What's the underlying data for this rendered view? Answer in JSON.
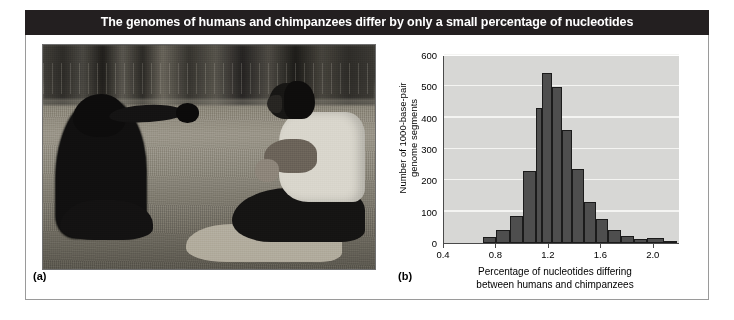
{
  "figure": {
    "title": "The genomes of humans and chimpanzees differ by only a small percentage of nucleotides",
    "title_bg": "#231f20",
    "title_color": "#ffffff",
    "frame_border": "#9a9a9a"
  },
  "panel_a": {
    "label": "(a)",
    "photo_alt": "Black-and-white photograph of a chimpanzee and a man sitting facing each other on grass, the chimpanzee reaching out toward the man"
  },
  "panel_b": {
    "label": "(b)"
  },
  "chart_data": {
    "type": "bar",
    "title": "",
    "subtitle": "",
    "xlabel": "Percentage of nucleotides differing between humans and chimpanzees",
    "xlabel_line1": "Percentage of nucleotides differing",
    "xlabel_line2": "between humans and chimpanzees",
    "ylabel": "Number of 1000-base-pair genome segments",
    "ylabel_line1": "Number of 1000-base-pair",
    "ylabel_line2": "genome segments",
    "xlim": [
      0.4,
      2.2
    ],
    "ylim": [
      0,
      600
    ],
    "bin_width": 0.1,
    "grid": true,
    "grid_axis": "y",
    "legend": "none",
    "bar_color": "#4e4e4e",
    "bar_edge_color": "#1b1b1b",
    "plot_bg": "#d7d7d5",
    "ytick_labels": [
      "0",
      "100",
      "200",
      "300",
      "400",
      "500",
      "600"
    ],
    "yticks": [
      0,
      100,
      200,
      300,
      400,
      500,
      600
    ],
    "xtick_labels": [
      "0.4",
      "0.8",
      "1.2",
      "1.6",
      "2.0"
    ],
    "xticks": [
      0.4,
      0.8,
      1.2,
      1.6,
      2.0
    ],
    "bin_starts": [
      0.7,
      0.8,
      0.9,
      1.0,
      1.1,
      1.2,
      1.3,
      1.4,
      1.5,
      1.6,
      1.7,
      1.8,
      1.9,
      2.0,
      2.1
    ],
    "bin_centers": [
      0.75,
      0.85,
      0.95,
      1.05,
      1.15,
      1.25,
      1.35,
      1.45,
      1.55,
      1.65,
      1.75,
      1.85,
      1.95,
      2.05,
      2.15
    ],
    "values": [
      18,
      42,
      85,
      230,
      432,
      543,
      498,
      360,
      235,
      130,
      78,
      42,
      22,
      12,
      15,
      8
    ],
    "bars": [
      {
        "x0": 0.7,
        "x1": 0.8,
        "value": 18
      },
      {
        "x0": 0.8,
        "x1": 0.9,
        "value": 42
      },
      {
        "x0": 0.9,
        "x1": 1.0,
        "value": 85
      },
      {
        "x0": 1.0,
        "x1": 1.1,
        "value": 230
      },
      {
        "x0": 1.1,
        "x1": 1.15,
        "value": 432
      },
      {
        "x0": 1.15,
        "x1": 1.22,
        "value": 543
      },
      {
        "x0": 1.22,
        "x1": 1.3,
        "value": 498
      },
      {
        "x0": 1.3,
        "x1": 1.38,
        "value": 360
      },
      {
        "x0": 1.38,
        "x1": 1.47,
        "value": 235
      },
      {
        "x0": 1.47,
        "x1": 1.56,
        "value": 130
      },
      {
        "x0": 1.56,
        "x1": 1.65,
        "value": 78
      },
      {
        "x0": 1.65,
        "x1": 1.75,
        "value": 42
      },
      {
        "x0": 1.75,
        "x1": 1.85,
        "value": 22
      },
      {
        "x0": 1.85,
        "x1": 1.95,
        "value": 12
      },
      {
        "x0": 1.95,
        "x1": 2.08,
        "value": 15
      },
      {
        "x0": 2.08,
        "x1": 2.18,
        "value": 8
      }
    ]
  }
}
